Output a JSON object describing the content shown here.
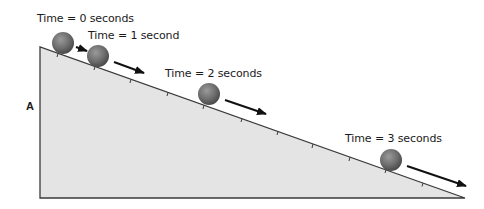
{
  "diagram": {
    "side_label": "A",
    "colors": {
      "ramp_fill": "#e4e4e4",
      "ramp_stroke": "#3a3a3a",
      "ball": "#6e6e6e",
      "arrow": "#111111",
      "text": "#1a1a1a"
    },
    "ramp": {
      "top": [
        40,
        47
      ],
      "bottom_left": [
        40,
        198
      ],
      "bottom_right": [
        465,
        198
      ]
    },
    "positions": [
      {
        "label": "Time = 0 seconds",
        "time_s": 0,
        "ball": [
          63,
          43
        ],
        "label_pos": [
          37,
          13
        ]
      },
      {
        "label": "Time = 1 second",
        "time_s": 1,
        "ball": [
          98,
          56
        ],
        "label_pos": [
          88,
          30
        ]
      },
      {
        "label": "Time = 2 seconds",
        "time_s": 2,
        "ball": [
          209,
          94
        ],
        "label_pos": [
          165,
          67
        ]
      },
      {
        "label": "Time = 3 seconds",
        "time_s": 3,
        "ball": [
          391,
          160
        ],
        "label_pos": [
          345,
          133
        ]
      }
    ]
  }
}
